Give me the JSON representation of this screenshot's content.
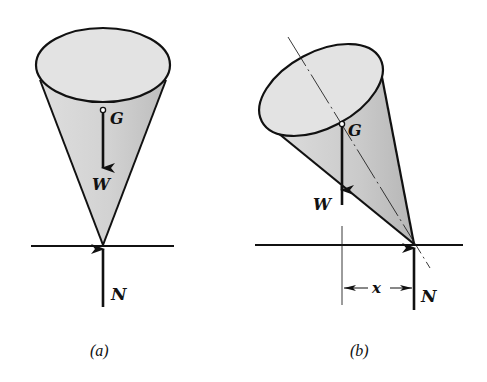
{
  "figure": {
    "colors": {
      "ink": "#111111",
      "cone_fill": "#cfcfcf",
      "top_fill": "#e2e2e2",
      "background": "#ffffff"
    },
    "panels": [
      {
        "id": "a",
        "caption": "(a)",
        "labels": {
          "centroid": "G",
          "weight": "W",
          "normal": "N"
        },
        "state": "upright, G directly above contact point"
      },
      {
        "id": "b",
        "caption": "(b)",
        "labels": {
          "centroid": "G",
          "weight": "W",
          "normal": "N",
          "offset": "x"
        },
        "state": "tilted, W offset horizontally by x from N"
      }
    ]
  }
}
